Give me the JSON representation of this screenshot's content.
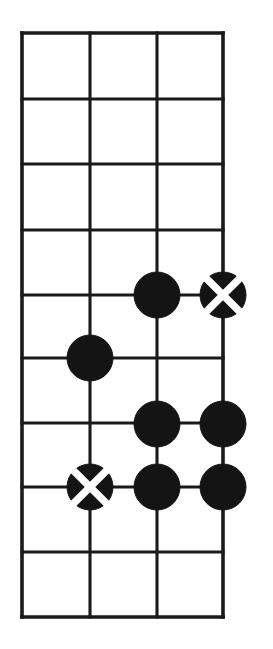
{
  "figure": {
    "kind": "go-board-diagram",
    "background_color": "#ffffff",
    "line_color": "#1a1a1a",
    "stone_black_color": "#141414",
    "stone_mark_color": "#ffffff"
  },
  "board": {
    "columns": 4,
    "rows": 10,
    "cell_size": 65,
    "origin_x": 22,
    "origin_y": 33,
    "line_x": [
      22,
      90,
      157,
      223
    ],
    "line_y": [
      33,
      99,
      164,
      230,
      295,
      358,
      423,
      487,
      552,
      617
    ],
    "stone_radius": 23
  },
  "stones": [
    {
      "id": "stone-1",
      "color": "black",
      "mark": "none",
      "col": 2,
      "row": 4,
      "x": 157,
      "y": 295
    },
    {
      "id": "stone-2",
      "color": "black",
      "mark": "cross",
      "col": 3,
      "row": 4,
      "x": 223,
      "y": 295
    },
    {
      "id": "stone-3",
      "color": "black",
      "mark": "none",
      "col": 1,
      "row": 5,
      "x": 90,
      "y": 358
    },
    {
      "id": "stone-4",
      "color": "black",
      "mark": "none",
      "col": 2,
      "row": 6,
      "x": 157,
      "y": 424
    },
    {
      "id": "stone-5",
      "color": "black",
      "mark": "none",
      "col": 3,
      "row": 6,
      "x": 223,
      "y": 424
    },
    {
      "id": "stone-6",
      "color": "black",
      "mark": "cross",
      "col": 1,
      "row": 7,
      "x": 90,
      "y": 487
    },
    {
      "id": "stone-7",
      "color": "black",
      "mark": "none",
      "col": 2,
      "row": 7,
      "x": 157,
      "y": 487
    },
    {
      "id": "stone-8",
      "color": "black",
      "mark": "none",
      "col": 3,
      "row": 7,
      "x": 223,
      "y": 487
    }
  ]
}
